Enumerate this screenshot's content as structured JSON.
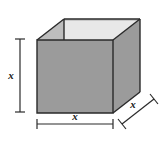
{
  "figure": {
    "name": "open-top-box-with-dimensions",
    "background_color": "#ffffff",
    "shape": {
      "type": "open-box",
      "solid_name": "cube",
      "faces": {
        "front": {
          "name": "front-face",
          "fill": "#9b9b9b",
          "points": "37,40 113,40 113,113 37,113"
        },
        "right": {
          "name": "right-face",
          "fill": "#9b9b9b",
          "points": "113,40 140,19 140,92 113,113"
        },
        "interior_back": {
          "name": "interior-back-wall",
          "fill": "#c9c9c9",
          "points": "64,19 140,19 140,21 64,21"
        },
        "interior_left": {
          "name": "interior-left-wall",
          "fill": "#bdbdbd",
          "points": "37,40 64,19 64,40"
        },
        "interior_floor": {
          "name": "interior-visible-gap",
          "fill": "#e8e8e8",
          "points": "64,19 140,19 113,40 37,40"
        }
      },
      "edge_color": "#2a2a2a",
      "edge_width": 1.4
    },
    "dimensions": [
      {
        "name": "height-dimension",
        "label": "x",
        "orientation": "vertical",
        "position": "left",
        "line": {
          "x1": 20,
          "y1": 39,
          "x2": 20,
          "y2": 112
        },
        "label_x": 12,
        "label_y": 79
      },
      {
        "name": "width-dimension",
        "label": "x",
        "orientation": "horizontal",
        "position": "bottom",
        "line": {
          "x1": 37,
          "y1": 124,
          "x2": 113,
          "y2": 124
        },
        "label_x": 75,
        "label_y": 120
      },
      {
        "name": "depth-dimension",
        "label": "x",
        "orientation": "diagonal",
        "position": "bottom-right",
        "line": {
          "x1": 122,
          "y1": 124,
          "x2": 154,
          "y2": 99
        },
        "label_x": 134,
        "label_y": 108
      }
    ],
    "tick_color": "#2a2a2a",
    "dim_line_color": "#2a2a2a"
  }
}
